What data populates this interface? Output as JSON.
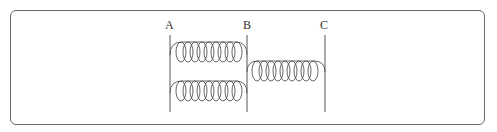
{
  "diagram": {
    "type": "circuit",
    "nodes": [
      {
        "id": "A",
        "label": "A"
      },
      {
        "id": "B",
        "label": "B"
      },
      {
        "id": "C",
        "label": "C"
      }
    ],
    "components": [
      {
        "type": "coil",
        "from": "A",
        "to": "B",
        "position": "upper",
        "turns": 9
      },
      {
        "type": "coil",
        "from": "A",
        "to": "B",
        "position": "lower",
        "turns": 9
      },
      {
        "type": "coil",
        "from": "B",
        "to": "C",
        "position": "single",
        "turns": 9
      }
    ],
    "colors": {
      "line": "#555555",
      "frame": "#6a6a6a"
    }
  }
}
